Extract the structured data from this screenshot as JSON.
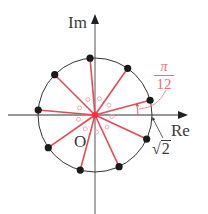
{
  "diagram": {
    "type": "complex-plane-roots",
    "axes": {
      "real_label": "Re",
      "imag_label": "Im",
      "origin_label": "O"
    },
    "circle": {
      "radius_label": "√2",
      "radius_symbol": "2"
    },
    "angle_label": {
      "numerator": "π",
      "denominator": "12"
    },
    "points": {
      "count": 9,
      "start_angle_deg": 15,
      "step_deg": 40
    },
    "inner_points": {
      "count": 9
    },
    "colors": {
      "axis": "#333333",
      "circle": "#333333",
      "ray": "#e84a55",
      "dot": "#1a1a1a",
      "inner_circle": "#f0a0a8",
      "angle_label": "#ec6c78"
    }
  }
}
